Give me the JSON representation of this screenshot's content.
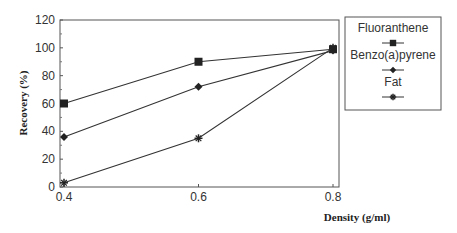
{
  "chart_data": {
    "type": "line",
    "title": "",
    "xlabel": "Density (g/ml)",
    "ylabel": "Recovery (%)",
    "x": [
      0.4,
      0.6,
      0.8
    ],
    "x_tick_labels": [
      "0.4",
      "0.6",
      "0.8"
    ],
    "y_tick_labels": [
      "0",
      "20",
      "40",
      "60",
      "80",
      "100",
      "120"
    ],
    "ylim": [
      0,
      120
    ],
    "xlim": [
      0.4,
      0.8
    ],
    "grid": false,
    "legend_position": "right",
    "series": [
      {
        "name": "Fluoranthene",
        "marker": "square",
        "values": [
          60,
          90,
          99
        ]
      },
      {
        "name": "Benzo(a)pyrene",
        "marker": "diamond",
        "values": [
          36,
          72,
          98
        ]
      },
      {
        "name": "Fat",
        "marker": "star",
        "values": [
          3,
          35,
          100
        ]
      }
    ]
  }
}
